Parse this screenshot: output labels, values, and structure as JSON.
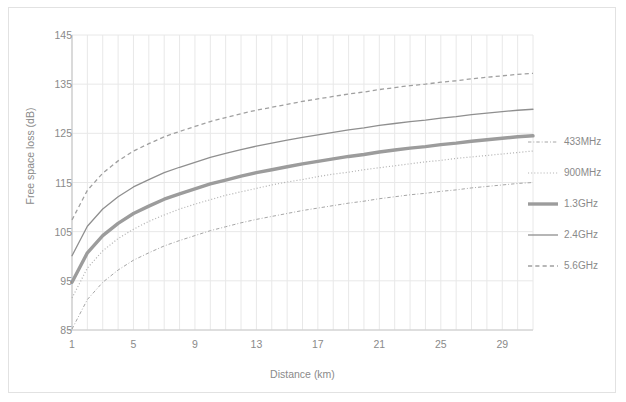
{
  "chart_data": {
    "type": "line",
    "title": "",
    "xlabel": "Distance (km)",
    "ylabel": "Free space loss (dB)",
    "xlim": [
      1,
      31
    ],
    "ylim": [
      85,
      145
    ],
    "xticks": [
      1,
      5,
      9,
      13,
      17,
      21,
      25,
      29
    ],
    "yticks": [
      85,
      95,
      105,
      115,
      125,
      135,
      145
    ],
    "grid": true,
    "minor_x_gridlines": true,
    "legend_position": "right",
    "x": [
      1,
      2,
      3,
      4,
      5,
      6,
      7,
      8,
      9,
      10,
      11,
      12,
      13,
      14,
      15,
      16,
      17,
      18,
      19,
      20,
      21,
      22,
      23,
      24,
      25,
      26,
      27,
      28,
      29,
      30,
      31
    ],
    "series": [
      {
        "name": "433MHz",
        "style": "dash-dot",
        "color": "#a6a6a6",
        "width": 1,
        "values": [
          85.2,
          91.2,
          94.7,
          97.2,
          99.2,
          100.7,
          102.1,
          103.2,
          104.2,
          105.2,
          106.0,
          106.8,
          107.5,
          108.1,
          108.7,
          109.3,
          109.8,
          110.3,
          110.8,
          111.2,
          111.7,
          112.1,
          112.5,
          112.8,
          113.2,
          113.5,
          113.9,
          114.2,
          114.5,
          114.8,
          115.0
        ]
      },
      {
        "name": "900MHz",
        "style": "dotted",
        "color": "#b5b5b5",
        "width": 1.2,
        "values": [
          91.5,
          97.6,
          101.1,
          103.6,
          105.5,
          107.1,
          108.4,
          109.6,
          110.6,
          111.5,
          112.4,
          113.1,
          113.8,
          114.5,
          115.1,
          115.6,
          116.2,
          116.7,
          117.1,
          117.6,
          118.0,
          118.4,
          118.8,
          119.2,
          119.5,
          119.9,
          120.2,
          120.5,
          120.8,
          121.1,
          121.4
        ]
      },
      {
        "name": "1.3GHz",
        "style": "solid",
        "color": "#9c9c9c",
        "width": 3.4,
        "values": [
          94.7,
          100.7,
          104.2,
          106.7,
          108.7,
          110.2,
          111.6,
          112.7,
          113.7,
          114.7,
          115.5,
          116.3,
          117.0,
          117.6,
          118.2,
          118.8,
          119.3,
          119.8,
          120.3,
          120.7,
          121.2,
          121.6,
          122.0,
          122.3,
          122.7,
          123.0,
          123.4,
          123.7,
          124.0,
          124.3,
          124.5
        ]
      },
      {
        "name": "2.4GHz",
        "style": "solid",
        "color": "#8f8f8f",
        "width": 1.3,
        "values": [
          100.1,
          106.1,
          109.6,
          112.1,
          114.1,
          115.6,
          117.0,
          118.1,
          119.1,
          120.1,
          120.9,
          121.7,
          122.4,
          123.0,
          123.6,
          124.2,
          124.7,
          125.2,
          125.7,
          126.1,
          126.6,
          127.0,
          127.4,
          127.7,
          128.1,
          128.4,
          128.8,
          129.1,
          129.4,
          129.7,
          129.9
        ]
      },
      {
        "name": "5.6GHz",
        "style": "dashed",
        "color": "#a0a0a0",
        "width": 1.3,
        "values": [
          107.4,
          113.4,
          116.9,
          119.4,
          121.4,
          122.9,
          124.3,
          125.4,
          126.4,
          127.4,
          128.2,
          129.0,
          129.7,
          130.3,
          130.9,
          131.5,
          132.0,
          132.5,
          133.0,
          133.4,
          133.9,
          134.3,
          134.7,
          135.0,
          135.4,
          135.7,
          136.1,
          136.4,
          136.7,
          137.0,
          137.2
        ]
      }
    ]
  },
  "axes": {
    "ylabel_text": "Free space loss (dB)",
    "xlabel_text": "Distance (km)",
    "ytick_labels": [
      "145",
      "135",
      "125",
      "115",
      "105",
      "95",
      "85"
    ],
    "xtick_labels": [
      "1",
      "5",
      "9",
      "13",
      "17",
      "21",
      "25",
      "29"
    ]
  },
  "legend": {
    "items": [
      {
        "label": "433MHz"
      },
      {
        "label": "900MHz"
      },
      {
        "label": "1.3GHz"
      },
      {
        "label": "2.4GHz"
      },
      {
        "label": "5.6GHz"
      }
    ]
  },
  "colors": {
    "grid": "#e8e8e8",
    "axis": "#c9c9c9",
    "text": "#8a8a8a",
    "border": "#e2e2e2",
    "background": "#ffffff"
  }
}
